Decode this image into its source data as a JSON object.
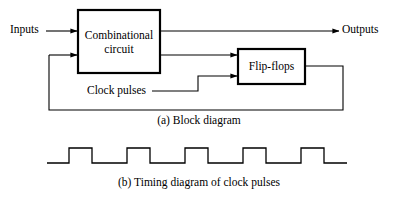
{
  "figure": {
    "width": 398,
    "height": 198,
    "background": "#ffffff",
    "stroke_color": "#000000"
  },
  "block_diagram": {
    "caption": "(a) Block diagram",
    "blocks": [
      {
        "id": "combinational-circuit",
        "label_line1": "Combinational",
        "label_line2": "circuit",
        "x": 78,
        "y": 10,
        "width": 82,
        "height": 63,
        "border_width": 2.2
      },
      {
        "id": "flip-flops",
        "label_line1": "Flip-flops",
        "label_line2": "",
        "x": 238,
        "y": 49,
        "width": 67,
        "height": 35,
        "border_width": 2.2
      }
    ],
    "labels": {
      "inputs": "Inputs",
      "outputs": "Outputs",
      "clock_pulses": "Clock pulses"
    }
  },
  "timing_diagram": {
    "caption": "(b) Timing diagram of clock pulses",
    "baseline_y": 163,
    "high_y": 148,
    "start_x": 47,
    "end_x": 347,
    "pulse_count": 5,
    "period": 58,
    "first_rise_x": 69,
    "pulse_width": 23,
    "pulses": [
      {
        "rise_x": 69,
        "fall_x": 92
      },
      {
        "rise_x": 127,
        "fall_x": 150
      },
      {
        "rise_x": 185,
        "fall_x": 208
      },
      {
        "rise_x": 243,
        "fall_x": 266
      },
      {
        "rise_x": 301,
        "fall_x": 324
      }
    ]
  }
}
